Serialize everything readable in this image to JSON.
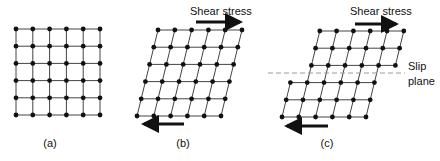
{
  "figure": {
    "colors": {
      "ink": "#111111",
      "line": "#444444",
      "slip_line": "#999999",
      "background": "#ffffff"
    },
    "panels": [
      {
        "id": "a",
        "caption": "(a)",
        "description": "Undeformed square lattice",
        "rows": 6,
        "cols": 6
      },
      {
        "id": "b",
        "caption": "(b)",
        "description": "Elastically sheared lattice",
        "rows": 6,
        "cols": 6,
        "stress_label": "Shear stress"
      },
      {
        "id": "c",
        "caption": "(c)",
        "description": "Lattice slipped along slip plane",
        "rows": 6,
        "cols": 6,
        "stress_label": "Shear stress",
        "slip_label_line1": "Slip",
        "slip_label_line2": "plane"
      }
    ]
  }
}
